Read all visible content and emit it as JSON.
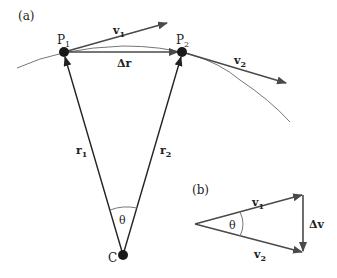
{
  "panel_a": {
    "label": "(a)",
    "points": {
      "P1": {
        "name": "P",
        "sub": "1"
      },
      "P2": {
        "name": "P",
        "sub": "2"
      },
      "C": {
        "name": "C"
      }
    },
    "vectors": {
      "v1": {
        "name": "v",
        "sub": "1"
      },
      "v2": {
        "name": "v",
        "sub": "2"
      },
      "r1": {
        "name": "r",
        "sub": "1"
      },
      "r2": {
        "name": "r",
        "sub": "2"
      },
      "dr": {
        "name": "Δr"
      }
    },
    "angle": "θ"
  },
  "panel_b": {
    "label": "(b)",
    "vectors": {
      "v1": {
        "name": "v",
        "sub": "1"
      },
      "v2": {
        "name": "v",
        "sub": "2"
      },
      "dv": {
        "name": "Δv"
      }
    },
    "angle": "θ"
  },
  "colors": {
    "arrow": "#4a4a4a",
    "curve": "#777777",
    "point": "#1a1a1a"
  }
}
